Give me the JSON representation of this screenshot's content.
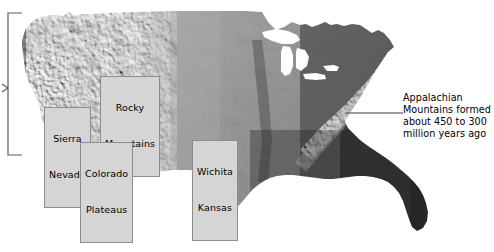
{
  "figure": {
    "type": "shaded-relief-map",
    "region": "Contiguous United States",
    "background_color": "#ffffff",
    "map_tone": "grayscale"
  },
  "map_labels": [
    {
      "id": "rocky",
      "name": "rocky-mountains-label",
      "lines": [
        "Rocky",
        "Mountains"
      ]
    },
    {
      "id": "sierra",
      "name": "sierra-nevada-label",
      "lines": [
        "Sierra",
        "Nevada"
      ]
    },
    {
      "id": "colorado",
      "name": "colorado-plateaus-label",
      "lines": [
        "Colorado",
        "Plateaus"
      ]
    },
    {
      "id": "wichita",
      "name": "wichita-kansas-label",
      "lines": [
        "Wichita",
        "Kansas"
      ]
    }
  ],
  "label_text": {
    "rocky_line1": "Rocky",
    "rocky_line2": "Mountains",
    "sierra_line1": "Sierra",
    "sierra_line2": "Nevada",
    "colorado_line1": "Colorado",
    "colorado_line2": "Plateaus",
    "wichita_line1": "Wichita",
    "wichita_line2": "Kansas"
  },
  "annotation": {
    "line1": "Appalachian",
    "line2": "Mountains formed",
    "line3": "about 450 to 300",
    "line4": "million years ago",
    "full_text": "Appalachian Mountains formed about 450 to 300 million years ago",
    "leader_line": true
  },
  "bracket": {
    "name": "west-coast-bracket",
    "orientation": "left",
    "has_center_tick": true
  },
  "colors": {
    "label_fill": "#d5d5d5",
    "label_border": "#8d8d8d",
    "text": "#000000",
    "line": "#555555",
    "water": "#ffffff"
  }
}
